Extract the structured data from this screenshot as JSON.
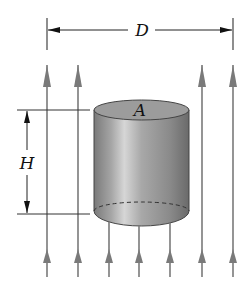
{
  "figure": {
    "type": "physics-diagram",
    "labels": {
      "width": "D",
      "height": "H",
      "area": "A"
    },
    "field_lines": {
      "direction": "up",
      "count": 7,
      "x_positions": [
        47,
        78,
        109,
        139,
        170,
        202,
        233
      ],
      "color": "#7a7a7a"
    },
    "cylinder": {
      "fill_dark": "#6e6e6e",
      "fill_light": "#d4d4d4",
      "top_fill": "#9a9a9a",
      "outline": "#444444"
    },
    "dimension_color": "#222222"
  }
}
